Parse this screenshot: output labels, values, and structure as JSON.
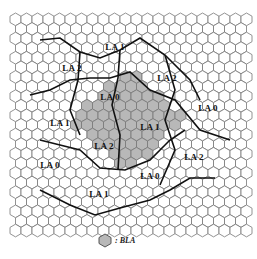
{
  "figure": {
    "grid": {
      "hex_width": 11,
      "row_step": 9.6,
      "cols": 22,
      "rows": 23,
      "origin_x": 10,
      "origin_y": 13
    },
    "colors": {
      "cell_stroke": "#777777",
      "boundary_stroke": "#111111",
      "shaded_fill": "#b8b8b8",
      "background": "#ffffff"
    },
    "labels": [
      {
        "text": "LA 1",
        "x": 115,
        "y": 47
      },
      {
        "text": "LA 2",
        "x": 72,
        "y": 68
      },
      {
        "text": "LA 2",
        "x": 167,
        "y": 78
      },
      {
        "text": "LA 0",
        "x": 110,
        "y": 97
      },
      {
        "text": "LA 0",
        "x": 208,
        "y": 108
      },
      {
        "text": "LA 1",
        "x": 60,
        "y": 123
      },
      {
        "text": "LA 1",
        "x": 150,
        "y": 127
      },
      {
        "text": "LA 2",
        "x": 104,
        "y": 146
      },
      {
        "text": "LA 0",
        "x": 50,
        "y": 165
      },
      {
        "text": "LA 2",
        "x": 194,
        "y": 157
      },
      {
        "text": "LA 0",
        "x": 150,
        "y": 176
      },
      {
        "text": "LA 1",
        "x": 99,
        "y": 194
      }
    ],
    "legend": {
      "symbol": "shaded-hexagon",
      "text": ": BLA"
    }
  }
}
